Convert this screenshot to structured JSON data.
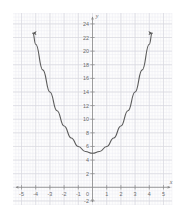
{
  "figure": {
    "background_color": "#ffffff",
    "plot_background_color": "#fdfdfd",
    "minor_grid_color": "#ededf2",
    "major_grid_color": "#d9d9e0",
    "axis_color": "#8a8a8a",
    "curve_color": "#5a5a5a",
    "label_color": "#6b6b6b"
  },
  "chart_data": {
    "type": "line",
    "title": "",
    "subtitle": "",
    "xlabel": "x",
    "ylabel": "y",
    "equation": "y = x^2 + 5",
    "xlim": [
      -5.6,
      5.6
    ],
    "ylim": [
      -2.6,
      25.6
    ],
    "grid": true,
    "minor_grid": true,
    "minor_ticks_per_unit_x": 5,
    "minor_ticks_per_unit_y": 2,
    "legend": "none",
    "arrows": {
      "curve_left_end": "arrow",
      "curve_right_end": "arrow",
      "x_axis_left": "arrow",
      "x_axis_right": "arrow",
      "y_axis_top": "arrow",
      "y_axis_bottom": "arrow"
    },
    "vertex": {
      "x": 0,
      "y": 5
    },
    "x_ticks": [
      -5,
      -4,
      -3,
      -2,
      -1,
      0,
      1,
      2,
      3,
      4,
      5
    ],
    "x_tick_labels": [
      "-5",
      "-4",
      "-3",
      "-2",
      "-1",
      "0",
      "1",
      "2",
      "3",
      "4",
      "5"
    ],
    "y_ticks": [
      -2,
      2,
      4,
      6,
      8,
      10,
      12,
      14,
      16,
      18,
      20,
      22,
      24
    ],
    "y_tick_labels": [
      "-2",
      "2",
      "4",
      "6",
      "8",
      "10",
      "12",
      "14",
      "16",
      "18",
      "20",
      "22",
      "24"
    ],
    "x": [
      -4.2,
      -4.0,
      -3.5,
      -3.0,
      -2.5,
      -2.0,
      -1.5,
      -1.0,
      -0.5,
      0.0,
      0.5,
      1.0,
      1.5,
      2.0,
      2.5,
      3.0,
      3.5,
      4.0,
      4.2
    ],
    "y": [
      22.64,
      21.0,
      17.25,
      14.0,
      11.25,
      9.0,
      7.25,
      6.0,
      5.25,
      5.0,
      5.25,
      6.0,
      7.25,
      9.0,
      11.25,
      14.0,
      17.25,
      21.0,
      22.64
    ],
    "series": [
      {
        "name": "y = x^2 + 5",
        "values": [
          22.64,
          21.0,
          17.25,
          14.0,
          11.25,
          9.0,
          7.25,
          6.0,
          5.25,
          5.0,
          5.25,
          6.0,
          7.25,
          9.0,
          11.25,
          14.0,
          17.25,
          21.0,
          22.64
        ]
      }
    ]
  }
}
